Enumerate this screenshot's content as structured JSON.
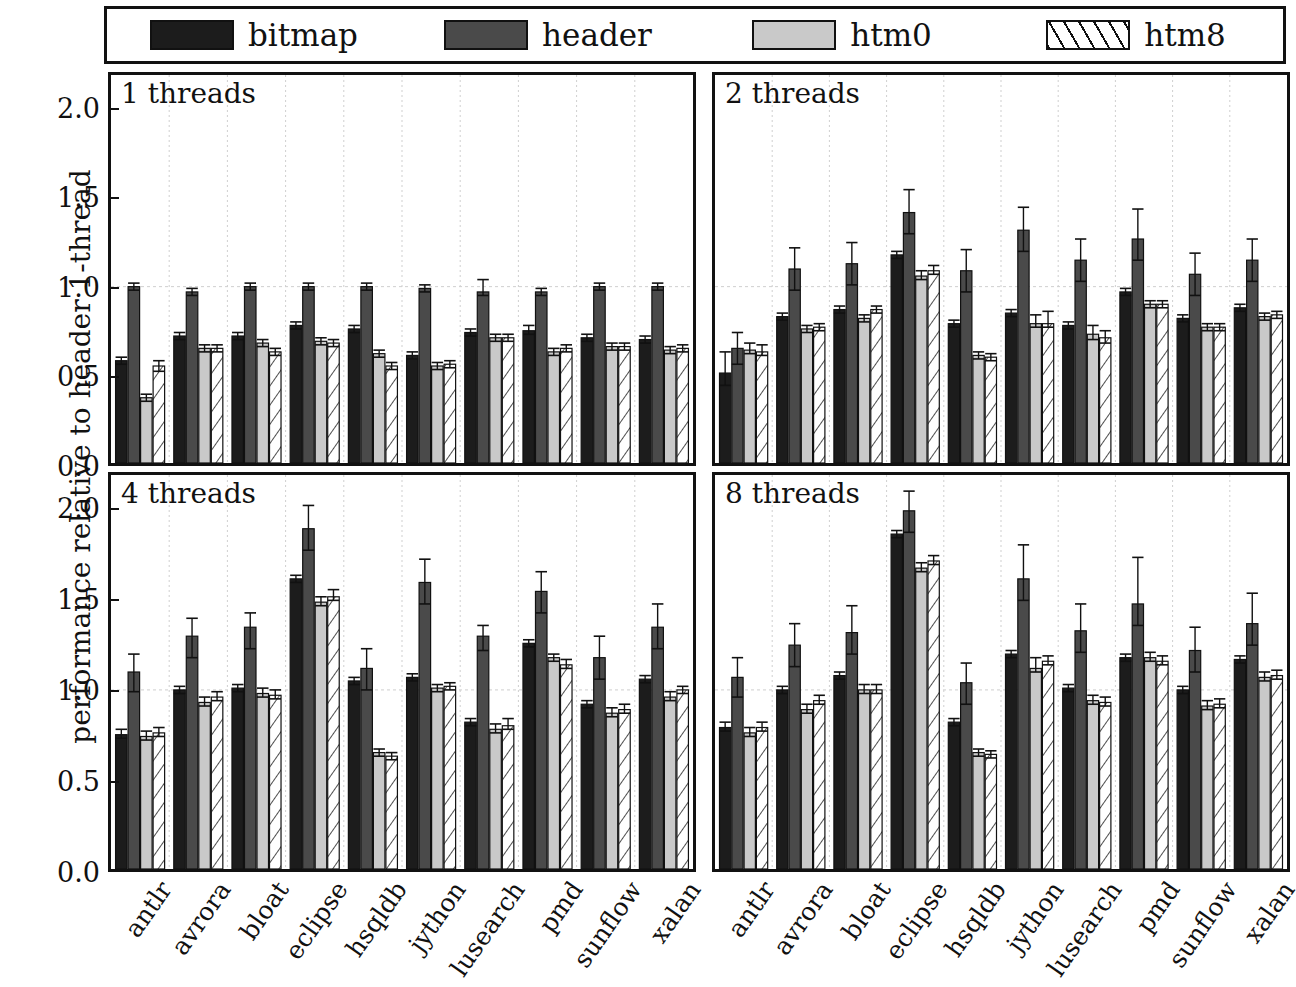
{
  "legend": {
    "items": [
      {
        "label": "bitmap",
        "key": "bitmap",
        "fill": "#1c1c1c",
        "pattern": "solid"
      },
      {
        "label": "header",
        "key": "header",
        "fill": "#4a4a4a",
        "pattern": "solid"
      },
      {
        "label": "htm0",
        "key": "htm0",
        "fill": "#c9c9c9",
        "pattern": "solid"
      },
      {
        "label": "htm8",
        "key": "htm8",
        "fill": "#ffffff",
        "pattern": "diagonal-hatch"
      }
    ]
  },
  "axes": {
    "ylabel": "performance relative to header 1-thread",
    "yticks": [
      0.0,
      0.5,
      1.0,
      1.5,
      2.0
    ],
    "ytick_labels": [
      "0.0",
      "0.5",
      "1.0",
      "1.5",
      "2.0"
    ],
    "ylim": [
      0.0,
      2.2
    ],
    "gridline_at": 1.0,
    "grid": true
  },
  "chart_data": {
    "type": "bar",
    "title": "",
    "xlabel": "",
    "ylabel": "performance relative to header 1-thread",
    "ylim": [
      0.0,
      2.2
    ],
    "grid": true,
    "legend_position": "top",
    "categories": [
      "antlr",
      "avrora",
      "bloat",
      "eclipse",
      "hsqldb",
      "jython",
      "lusearch",
      "pmd",
      "sunflow",
      "xalan"
    ],
    "series_names": [
      "bitmap",
      "header",
      "htm0",
      "htm8"
    ],
    "panels": [
      {
        "title": "1 threads",
        "threads": 1,
        "series": [
          {
            "name": "bitmap",
            "values": [
              0.58,
              0.72,
              0.72,
              0.78,
              0.76,
              0.61,
              0.74,
              0.75,
              0.71,
              0.7
            ],
            "err_low": [
              0.56,
              0.7,
              0.7,
              0.76,
              0.74,
              0.59,
              0.72,
              0.73,
              0.69,
              0.68
            ],
            "err_high": [
              0.6,
              0.74,
              0.74,
              0.8,
              0.78,
              0.63,
              0.76,
              0.78,
              0.73,
              0.72
            ]
          },
          {
            "name": "header",
            "values": [
              1.0,
              0.97,
              1.0,
              1.0,
              1.0,
              0.99,
              0.97,
              0.97,
              1.0,
              1.0
            ],
            "err_low": [
              0.98,
              0.95,
              0.98,
              0.98,
              0.98,
              0.97,
              0.95,
              0.95,
              0.98,
              0.98
            ],
            "err_high": [
              1.02,
              0.99,
              1.02,
              1.02,
              1.02,
              1.01,
              1.04,
              0.99,
              1.02,
              1.02
            ]
          },
          {
            "name": "htm0",
            "values": [
              0.37,
              0.65,
              0.68,
              0.69,
              0.62,
              0.55,
              0.71,
              0.63,
              0.66,
              0.64
            ],
            "err_low": [
              0.35,
              0.63,
              0.66,
              0.67,
              0.6,
              0.53,
              0.69,
              0.61,
              0.64,
              0.62
            ],
            "err_high": [
              0.39,
              0.67,
              0.7,
              0.71,
              0.64,
              0.57,
              0.73,
              0.65,
              0.68,
              0.66
            ]
          },
          {
            "name": "htm8",
            "values": [
              0.55,
              0.65,
              0.63,
              0.68,
              0.55,
              0.56,
              0.71,
              0.65,
              0.66,
              0.65
            ],
            "err_low": [
              0.52,
              0.63,
              0.61,
              0.66,
              0.53,
              0.54,
              0.69,
              0.63,
              0.64,
              0.63
            ],
            "err_high": [
              0.58,
              0.67,
              0.65,
              0.7,
              0.57,
              0.58,
              0.73,
              0.67,
              0.68,
              0.67
            ]
          }
        ]
      },
      {
        "title": "2 threads",
        "threads": 2,
        "series": [
          {
            "name": "bitmap",
            "values": [
              0.51,
              0.83,
              0.87,
              1.18,
              0.79,
              0.85,
              0.78,
              0.97,
              0.82,
              0.88
            ],
            "err_low": [
              0.44,
              0.81,
              0.85,
              1.16,
              0.77,
              0.83,
              0.76,
              0.95,
              0.8,
              0.86
            ],
            "err_high": [
              0.63,
              0.85,
              0.89,
              1.2,
              0.81,
              0.87,
              0.8,
              0.99,
              0.84,
              0.9
            ]
          },
          {
            "name": "header",
            "values": [
              0.65,
              1.1,
              1.13,
              1.42,
              1.09,
              1.32,
              1.15,
              1.27,
              1.07,
              1.15
            ],
            "err_low": [
              0.56,
              0.98,
              1.01,
              1.3,
              0.97,
              1.2,
              1.03,
              1.15,
              0.95,
              1.03
            ],
            "err_high": [
              0.74,
              1.22,
              1.25,
              1.55,
              1.21,
              1.45,
              1.27,
              1.44,
              1.19,
              1.27
            ]
          },
          {
            "name": "htm0",
            "values": [
              0.64,
              0.76,
              0.82,
              1.06,
              0.61,
              0.79,
              0.73,
              0.9,
              0.77,
              0.83
            ],
            "err_low": [
              0.62,
              0.74,
              0.8,
              1.04,
              0.59,
              0.77,
              0.7,
              0.88,
              0.75,
              0.81
            ],
            "err_high": [
              0.68,
              0.78,
              0.84,
              1.09,
              0.63,
              0.84,
              0.78,
              0.92,
              0.79,
              0.85
            ]
          },
          {
            "name": "htm8",
            "values": [
              0.63,
              0.77,
              0.87,
              1.09,
              0.6,
              0.79,
              0.71,
              0.9,
              0.77,
              0.84
            ],
            "err_low": [
              0.61,
              0.75,
              0.85,
              1.07,
              0.58,
              0.77,
              0.68,
              0.88,
              0.75,
              0.82
            ],
            "err_high": [
              0.67,
              0.79,
              0.89,
              1.12,
              0.62,
              0.86,
              0.75,
              0.92,
              0.79,
              0.86
            ]
          }
        ]
      },
      {
        "title": "4 threads",
        "threads": 4,
        "series": [
          {
            "name": "bitmap",
            "values": [
              0.75,
              1.0,
              1.01,
              1.62,
              1.05,
              1.07,
              0.82,
              1.26,
              0.92,
              1.06
            ],
            "err_low": [
              0.73,
              0.98,
              0.99,
              1.6,
              1.03,
              1.05,
              0.8,
              1.24,
              0.9,
              1.04
            ],
            "err_high": [
              0.78,
              1.02,
              1.03,
              1.64,
              1.07,
              1.09,
              0.84,
              1.28,
              0.94,
              1.08
            ]
          },
          {
            "name": "header",
            "values": [
              1.1,
              1.3,
              1.35,
              1.9,
              1.12,
              1.6,
              1.3,
              1.55,
              1.18,
              1.35
            ],
            "err_low": [
              0.99,
              1.18,
              1.23,
              1.78,
              1.0,
              1.48,
              1.22,
              1.43,
              1.06,
              1.23
            ],
            "err_high": [
              1.2,
              1.4,
              1.43,
              2.03,
              1.23,
              1.73,
              1.36,
              1.66,
              1.3,
              1.48
            ]
          },
          {
            "name": "htm0",
            "values": [
              0.74,
              0.93,
              0.98,
              1.49,
              0.65,
              1.01,
              0.78,
              1.18,
              0.87,
              0.96
            ],
            "err_low": [
              0.72,
              0.91,
              0.96,
              1.47,
              0.63,
              0.99,
              0.76,
              1.16,
              0.85,
              0.94
            ],
            "err_high": [
              0.77,
              0.96,
              1.01,
              1.52,
              0.67,
              1.03,
              0.81,
              1.2,
              0.9,
              0.99
            ]
          },
          {
            "name": "htm8",
            "values": [
              0.76,
              0.96,
              0.97,
              1.52,
              0.63,
              1.02,
              0.8,
              1.14,
              0.89,
              1.0
            ],
            "err_low": [
              0.74,
              0.94,
              0.95,
              1.5,
              0.61,
              1.0,
              0.78,
              1.12,
              0.87,
              0.98
            ],
            "err_high": [
              0.79,
              0.99,
              1.0,
              1.56,
              0.65,
              1.04,
              0.84,
              1.17,
              0.92,
              1.02
            ]
          }
        ]
      },
      {
        "title": "8 threads",
        "threads": 8,
        "series": [
          {
            "name": "bitmap",
            "values": [
              0.79,
              1.0,
              1.08,
              1.87,
              0.82,
              1.2,
              1.01,
              1.18,
              1.0,
              1.17
            ],
            "err_low": [
              0.77,
              0.98,
              1.06,
              1.85,
              0.8,
              1.18,
              0.99,
              1.16,
              0.98,
              1.15
            ],
            "err_high": [
              0.82,
              1.02,
              1.1,
              1.89,
              0.84,
              1.22,
              1.03,
              1.2,
              1.02,
              1.19
            ]
          },
          {
            "name": "header",
            "values": [
              1.07,
              1.25,
              1.32,
              2.0,
              1.04,
              1.62,
              1.33,
              1.48,
              1.22,
              1.37
            ],
            "err_low": [
              0.96,
              1.13,
              1.2,
              1.88,
              0.92,
              1.5,
              1.21,
              1.36,
              1.1,
              1.25
            ],
            "err_high": [
              1.18,
              1.37,
              1.47,
              2.11,
              1.15,
              1.81,
              1.48,
              1.74,
              1.35,
              1.54
            ]
          },
          {
            "name": "htm0",
            "values": [
              0.76,
              0.89,
              1.0,
              1.68,
              0.65,
              1.12,
              0.94,
              1.18,
              0.91,
              1.07
            ],
            "err_low": [
              0.74,
              0.87,
              0.98,
              1.66,
              0.63,
              1.1,
              0.92,
              1.16,
              0.89,
              1.05
            ],
            "err_high": [
              0.79,
              0.92,
              1.03,
              1.71,
              0.67,
              1.18,
              0.97,
              1.21,
              0.94,
              1.1
            ]
          },
          {
            "name": "htm8",
            "values": [
              0.79,
              0.94,
              1.0,
              1.72,
              0.64,
              1.16,
              0.93,
              1.16,
              0.92,
              1.08
            ],
            "err_low": [
              0.77,
              0.92,
              0.98,
              1.7,
              0.62,
              1.14,
              0.91,
              1.14,
              0.9,
              1.06
            ],
            "err_high": [
              0.82,
              0.97,
              1.03,
              1.75,
              0.66,
              1.19,
              0.96,
              1.19,
              0.95,
              1.11
            ]
          }
        ]
      }
    ]
  },
  "colors": {
    "bitmap": "#1c1c1c",
    "header": "#4a4a4a",
    "htm0": "#c9c9c9",
    "htm8": "#ffffff",
    "axis": "#111111",
    "grid": "#cfcfcf"
  }
}
